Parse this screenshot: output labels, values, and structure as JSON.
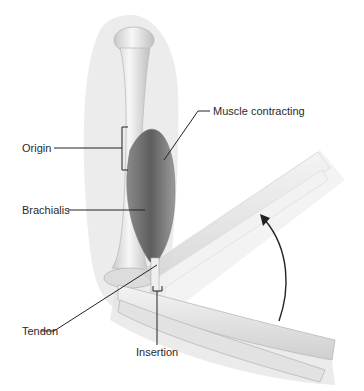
{
  "diagram": {
    "labels": {
      "origin": "Origin",
      "brachialis": "Brachialis",
      "tendon": "Tendon",
      "insertion": "Insertion",
      "muscle_contracting": "Muscle contracting"
    },
    "motion_arrow": "forearm-flexion-arrow",
    "colors": {
      "background": "#ffffff",
      "bone": "#ececec",
      "bone_shadow": "#bdbdbd",
      "muscle": "#6e6e6e",
      "skin_silhouette": "#e6e6e6",
      "leader_line": "#222222",
      "label_text": "#2a2a2a"
    }
  }
}
